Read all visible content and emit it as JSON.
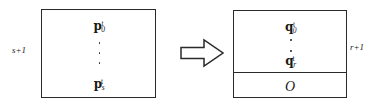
{
  "figure": {
    "ink_color": "#2a2a2a",
    "background_color": "#ffffff",
    "left_matrix": {
      "name": "source matrix block",
      "dimension_label": "s+1",
      "entries": [
        {
          "base": "p",
          "sub": "0",
          "sup": "t"
        },
        {
          "base": "p",
          "sub": "s",
          "sup": "t"
        }
      ],
      "ellipsis": "vertical-dots",
      "dot_count": 3
    },
    "arrow": {
      "name": "transformation arrow",
      "direction": "right",
      "style": "hollow-outline"
    },
    "right_matrix": {
      "name": "result matrix block",
      "dimension_label": "r+1",
      "entries": [
        {
          "base": "q",
          "sub": "0",
          "sup": "t"
        },
        {
          "base": "q",
          "sub": "r",
          "sup": "t"
        }
      ],
      "ellipsis": "vertical-dots",
      "dot_count": 2,
      "zero_block_label": "O"
    }
  }
}
